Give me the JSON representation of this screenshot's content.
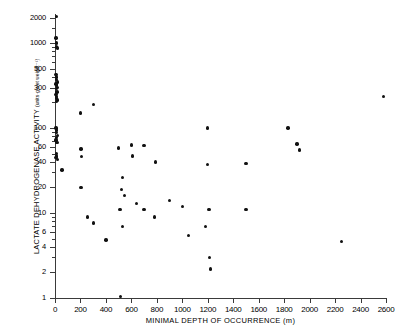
{
  "chart_data": {
    "type": "scatter",
    "title": "",
    "xlabel": "MINIMAL DEPTH OF OCCURRENCE (m)",
    "ylabel": "LACTATE DEHYDROGENASE ACTIVITY",
    "ylabel_units": "(units·g wet weight⁻¹)",
    "xlim": [
      0,
      2600
    ],
    "ylim": [
      1,
      2200
    ],
    "yscale": "log",
    "xscale": "linear",
    "grid": false,
    "legend": null,
    "xticks": [
      0,
      200,
      400,
      600,
      800,
      1000,
      1200,
      1400,
      1600,
      1800,
      2000,
      2200,
      2400,
      2600
    ],
    "xticklabels": [
      "0",
      "200",
      "400",
      "600",
      "800",
      "1000",
      "1200",
      "1400",
      "1600",
      "1800",
      "2000",
      "2200",
      "2400",
      "2600"
    ],
    "yticks": [
      1,
      2,
      4,
      6,
      10,
      20,
      40,
      60,
      100,
      300,
      500,
      1000,
      2000
    ],
    "yticklabels": [
      "1",
      "2",
      "4",
      "6",
      "10",
      "20",
      "40",
      "60",
      "100",
      "300",
      "500",
      "1000",
      "2000"
    ],
    "marker": "filled-circle",
    "marker_color": "#111111",
    "points": [
      {
        "x": 10,
        "y": 2050
      },
      {
        "x": 8,
        "y": 1150
      },
      {
        "x": 12,
        "y": 1000
      },
      {
        "x": 10,
        "y": 900
      },
      {
        "x": 20,
        "y": 880
      },
      {
        "x": 8,
        "y": 430
      },
      {
        "x": 14,
        "y": 400
      },
      {
        "x": 10,
        "y": 370
      },
      {
        "x": 18,
        "y": 350
      },
      {
        "x": 8,
        "y": 330
      },
      {
        "x": 12,
        "y": 320
      },
      {
        "x": 20,
        "y": 300
      },
      {
        "x": 10,
        "y": 290
      },
      {
        "x": 16,
        "y": 265
      },
      {
        "x": 8,
        "y": 250
      },
      {
        "x": 14,
        "y": 235
      },
      {
        "x": 10,
        "y": 225
      },
      {
        "x": 20,
        "y": 215
      },
      {
        "x": 12,
        "y": 205
      },
      {
        "x": 8,
        "y": 100
      },
      {
        "x": 14,
        "y": 95
      },
      {
        "x": 10,
        "y": 88
      },
      {
        "x": 18,
        "y": 82
      },
      {
        "x": 12,
        "y": 78
      },
      {
        "x": 8,
        "y": 72
      },
      {
        "x": 16,
        "y": 68
      },
      {
        "x": 10,
        "y": 50
      },
      {
        "x": 14,
        "y": 47
      },
      {
        "x": 8,
        "y": 45
      },
      {
        "x": 20,
        "y": 43
      },
      {
        "x": 55,
        "y": 32
      },
      {
        "x": 200,
        "y": 150
      },
      {
        "x": 300,
        "y": 190
      },
      {
        "x": 205,
        "y": 57
      },
      {
        "x": 210,
        "y": 46
      },
      {
        "x": 205,
        "y": 20
      },
      {
        "x": 255,
        "y": 9
      },
      {
        "x": 300,
        "y": 7.6
      },
      {
        "x": 400,
        "y": 4.8
      },
      {
        "x": 500,
        "y": 58
      },
      {
        "x": 530,
        "y": 26
      },
      {
        "x": 520,
        "y": 19
      },
      {
        "x": 545,
        "y": 16
      },
      {
        "x": 510,
        "y": 11
      },
      {
        "x": 530,
        "y": 7
      },
      {
        "x": 515,
        "y": 1.05
      },
      {
        "x": 600,
        "y": 63
      },
      {
        "x": 610,
        "y": 47
      },
      {
        "x": 640,
        "y": 13
      },
      {
        "x": 700,
        "y": 62
      },
      {
        "x": 790,
        "y": 40
      },
      {
        "x": 700,
        "y": 11
      },
      {
        "x": 780,
        "y": 9
      },
      {
        "x": 900,
        "y": 14
      },
      {
        "x": 1000,
        "y": 12
      },
      {
        "x": 1050,
        "y": 5.4
      },
      {
        "x": 1200,
        "y": 100
      },
      {
        "x": 1200,
        "y": 37
      },
      {
        "x": 1210,
        "y": 11
      },
      {
        "x": 1215,
        "y": 3
      },
      {
        "x": 1220,
        "y": 2.2
      },
      {
        "x": 1180,
        "y": 7
      },
      {
        "x": 1500,
        "y": 38
      },
      {
        "x": 1500,
        "y": 11
      },
      {
        "x": 1830,
        "y": 100
      },
      {
        "x": 1900,
        "y": 65
      },
      {
        "x": 1920,
        "y": 55
      },
      {
        "x": 2250,
        "y": 4.6
      },
      {
        "x": 2580,
        "y": 235
      }
    ]
  }
}
